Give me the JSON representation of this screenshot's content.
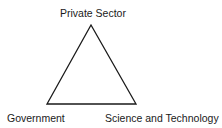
{
  "diagram": {
    "type": "triangle",
    "vertices": {
      "top": {
        "label": "Private Sector"
      },
      "bottom_left": {
        "label": "Government"
      },
      "bottom_right": {
        "label": "Science and Technology"
      }
    },
    "stroke_color": "#1a1a1a"
  }
}
